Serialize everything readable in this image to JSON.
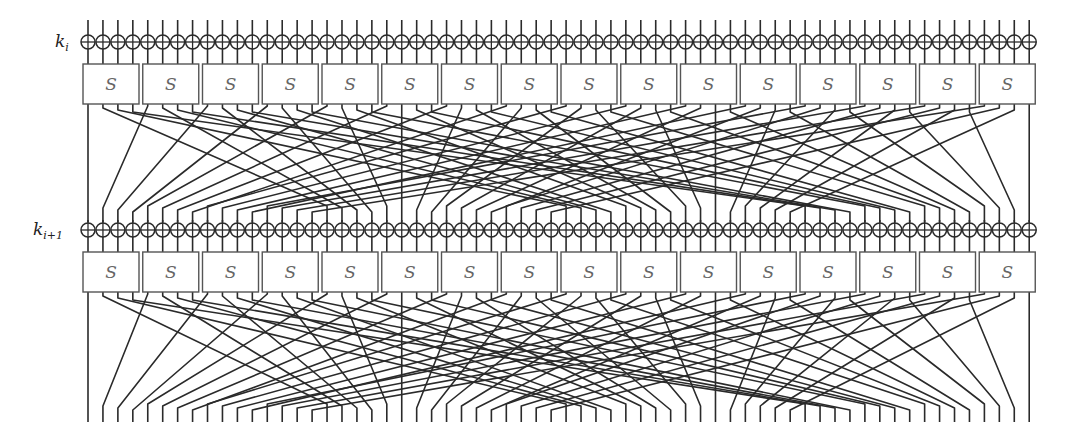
{
  "diagram": {
    "rounds": [
      {
        "key_label": "k",
        "key_subscript": "i"
      },
      {
        "key_label": "k",
        "key_subscript": "i+1"
      }
    ],
    "sbox_label": "S",
    "sbox_count": 16,
    "bits_per_sbox": 4,
    "state_bits": 64,
    "permutation": {
      "type": "PRESENT pLayer",
      "rule": "P(i) = 16*i mod 63, P(63) = 63"
    },
    "colors": {
      "wire": "#2a2a2a",
      "sbox_border": "#555555",
      "sbox_text": "#666666",
      "background": "#ffffff"
    },
    "geometry": {
      "first_bit_x": 88,
      "bit_spacing": 14.94,
      "sbox_left": 83,
      "sbox_pitch": 59.75,
      "sbox_width": 56,
      "wire_top_y": 20,
      "round_offsets_y": [
        0,
        188
      ],
      "xor_cy": 42,
      "xor_r": 7,
      "sbox_top": 64,
      "sbox_bottom": 104,
      "perm_start_y": 106,
      "perm_end_y": 212,
      "layer_bottom_y": 222,
      "final_bottom_y": 422
    }
  }
}
